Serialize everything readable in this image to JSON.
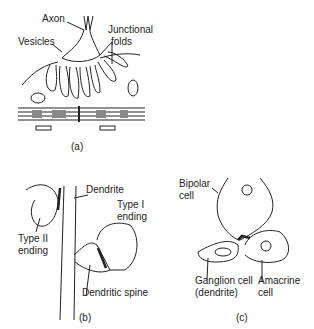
{
  "panel_a": {
    "caption": "(a)",
    "labels": {
      "axon": "Axon",
      "vesicles": "Vesicles",
      "junctional_folds_1": "Junctional",
      "junctional_folds_2": "folds"
    }
  },
  "panel_b": {
    "caption": "(b)",
    "labels": {
      "dendrite": "Dendrite",
      "type1_1": "Type I",
      "type1_2": "ending",
      "type2_1": "Type II",
      "type2_2": "ending",
      "spine": "Dendritic spine"
    }
  },
  "panel_c": {
    "caption": "(c)",
    "labels": {
      "bipolar_1": "Bipolar",
      "bipolar_2": "cell",
      "ganglion_1": "Ganglion cell",
      "ganglion_2": "(dendrite)",
      "amacrine_1": "Amacrine",
      "amacrine_2": "cell"
    }
  }
}
